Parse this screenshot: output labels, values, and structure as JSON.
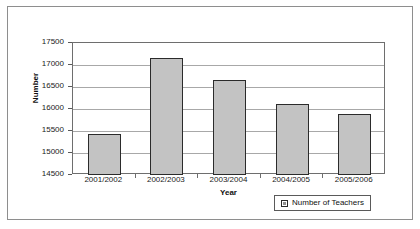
{
  "chart_data": {
    "type": "bar",
    "title": "",
    "xlabel": "Year",
    "ylabel": "Number",
    "categories": [
      "2001/2002",
      "2002/2003",
      "2003/2004",
      "2004/2005",
      "2005/2006"
    ],
    "series": [
      {
        "name": "Number of Teachers",
        "values": [
          15440,
          17150,
          16660,
          16120,
          15890
        ]
      }
    ],
    "ylim": [
      14500,
      17500
    ],
    "yticks": [
      14500,
      15000,
      15500,
      16000,
      16500,
      17000,
      17500
    ],
    "ytick_labels": [
      "14500",
      "15000",
      "15500",
      "16000",
      "16500",
      "17000",
      "17500"
    ],
    "grid": true,
    "legend_position": "bottom-right",
    "legend_entries": [
      "Number of Teachers"
    ],
    "colors": {
      "bar_fill": "#c3c3c3",
      "bar_border": "#2b2b2b",
      "gridline": "#a8a8a8",
      "axis": "#6e6e6e",
      "text": "#1a1a1a"
    }
  }
}
